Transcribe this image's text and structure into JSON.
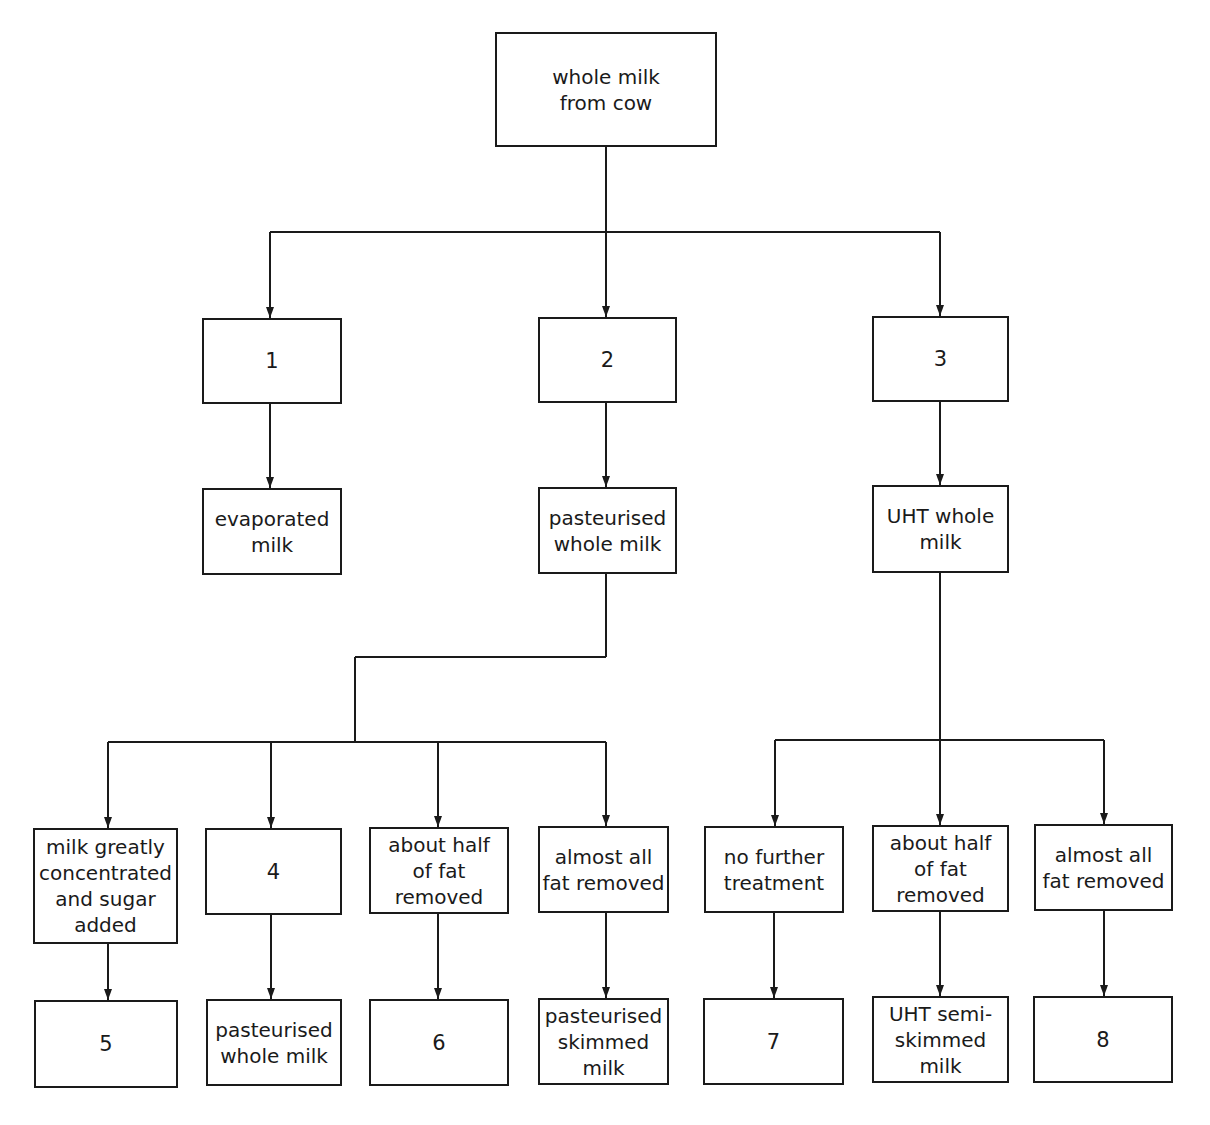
{
  "diagram": {
    "type": "flowchart",
    "root": {
      "id": "root",
      "label": "whole milk\nfrom cow",
      "x": 495,
      "y": 32,
      "w": 222,
      "h": 115
    },
    "nodes": [
      {
        "id": "n1",
        "label": "1",
        "x": 202,
        "y": 318,
        "w": 140,
        "h": 86,
        "num": true
      },
      {
        "id": "n2",
        "label": "2",
        "x": 538,
        "y": 317,
        "w": 139,
        "h": 86,
        "num": true
      },
      {
        "id": "n3",
        "label": "3",
        "x": 872,
        "y": 316,
        "w": 137,
        "h": 86,
        "num": true
      },
      {
        "id": "evap",
        "label": "evaporated\nmilk",
        "x": 202,
        "y": 488,
        "w": 140,
        "h": 87
      },
      {
        "id": "past",
        "label": "pasteurised\nwhole milk",
        "x": 538,
        "y": 487,
        "w": 139,
        "h": 87
      },
      {
        "id": "uht",
        "label": "UHT whole\nmilk",
        "x": 872,
        "y": 485,
        "w": 137,
        "h": 88
      },
      {
        "id": "cond",
        "label": "milk greatly\nconcentrated\nand sugar\nadded",
        "x": 33,
        "y": 828,
        "w": 145,
        "h": 116
      },
      {
        "id": "n4",
        "label": "4",
        "x": 205,
        "y": 828,
        "w": 137,
        "h": 87,
        "num": true
      },
      {
        "id": "half1",
        "label": "about half\nof fat\nremoved",
        "x": 369,
        "y": 827,
        "w": 140,
        "h": 87
      },
      {
        "id": "all1",
        "label": "almost all\nfat removed",
        "x": 538,
        "y": 826,
        "w": 131,
        "h": 87
      },
      {
        "id": "nofurther",
        "label": "no further\ntreatment",
        "x": 704,
        "y": 826,
        "w": 140,
        "h": 87
      },
      {
        "id": "half2",
        "label": "about half\nof fat\nremoved",
        "x": 872,
        "y": 825,
        "w": 137,
        "h": 87
      },
      {
        "id": "all2",
        "label": "almost all\nfat removed",
        "x": 1034,
        "y": 824,
        "w": 139,
        "h": 87
      },
      {
        "id": "n5",
        "label": "5",
        "x": 34,
        "y": 1000,
        "w": 144,
        "h": 88,
        "num": true
      },
      {
        "id": "pwm",
        "label": "pasteurised\nwhole milk",
        "x": 206,
        "y": 999,
        "w": 136,
        "h": 87
      },
      {
        "id": "n6",
        "label": "6",
        "x": 369,
        "y": 999,
        "w": 140,
        "h": 87,
        "num": true
      },
      {
        "id": "psm",
        "label": "pasteurised\nskimmed\nmilk",
        "x": 538,
        "y": 998,
        "w": 131,
        "h": 87
      },
      {
        "id": "n7",
        "label": "7",
        "x": 703,
        "y": 998,
        "w": 141,
        "h": 87,
        "num": true
      },
      {
        "id": "uhtsemi",
        "label": "UHT semi-\nskimmed\nmilk",
        "x": 872,
        "y": 996,
        "w": 137,
        "h": 87
      },
      {
        "id": "n8",
        "label": "8",
        "x": 1033,
        "y": 996,
        "w": 140,
        "h": 87,
        "num": true
      }
    ],
    "lines": [
      [
        606,
        147,
        606,
        232
      ],
      [
        270,
        232,
        940,
        232
      ],
      [
        270,
        232,
        270,
        318
      ],
      [
        606,
        232,
        606,
        317
      ],
      [
        940,
        232,
        940,
        316
      ],
      [
        270,
        404,
        270,
        488
      ],
      [
        606,
        403,
        606,
        487
      ],
      [
        940,
        402,
        940,
        485
      ],
      [
        606,
        574,
        606,
        657
      ],
      [
        355,
        657,
        606,
        657
      ],
      [
        355,
        657,
        355,
        742
      ],
      [
        108,
        742,
        606,
        742
      ],
      [
        108,
        742,
        108,
        828
      ],
      [
        271,
        742,
        271,
        828
      ],
      [
        438,
        742,
        438,
        827
      ],
      [
        606,
        742,
        606,
        826
      ],
      [
        940,
        573,
        940,
        825
      ],
      [
        775,
        740,
        1104,
        740
      ],
      [
        775,
        740,
        775,
        826
      ],
      [
        1104,
        740,
        1104,
        824
      ],
      [
        108,
        944,
        108,
        1000
      ],
      [
        271,
        915,
        271,
        999
      ],
      [
        438,
        914,
        438,
        999
      ],
      [
        606,
        913,
        606,
        998
      ],
      [
        774,
        913,
        774,
        998
      ],
      [
        940,
        912,
        940,
        996
      ],
      [
        1104,
        911,
        1104,
        996
      ]
    ],
    "arrow_ends": [
      [
        270,
        318
      ],
      [
        606,
        317
      ],
      [
        940,
        316
      ],
      [
        270,
        488
      ],
      [
        606,
        487
      ],
      [
        940,
        485
      ],
      [
        108,
        828
      ],
      [
        271,
        828
      ],
      [
        438,
        827
      ],
      [
        606,
        826
      ],
      [
        775,
        826
      ],
      [
        940,
        825
      ],
      [
        1104,
        824
      ],
      [
        108,
        1000
      ],
      [
        271,
        999
      ],
      [
        438,
        999
      ],
      [
        606,
        998
      ],
      [
        774,
        998
      ],
      [
        940,
        996
      ],
      [
        1104,
        996
      ]
    ]
  },
  "colors": {
    "line": "#1a1a1a",
    "background": "#ffffff"
  }
}
